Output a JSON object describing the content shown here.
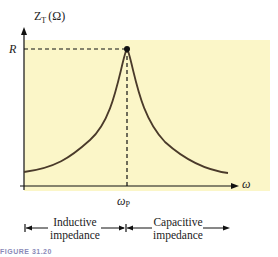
{
  "diagram": {
    "y_axis_label": "Z",
    "y_axis_subscript": "T",
    "y_axis_unit": "(Ω)",
    "x_axis_label": "ω",
    "peak_label": "R",
    "resonance_label": "ω",
    "resonance_subscript": "P",
    "left_region": {
      "line1": "Inductive",
      "line2": "impedance"
    },
    "right_region": {
      "line1": "Capacitive",
      "line2": "impedance"
    },
    "colors": {
      "panel": "#fbf6c8",
      "curve": "#4a3a2a",
      "axis": "#111111"
    }
  },
  "caption": "FIGURE 31.20"
}
